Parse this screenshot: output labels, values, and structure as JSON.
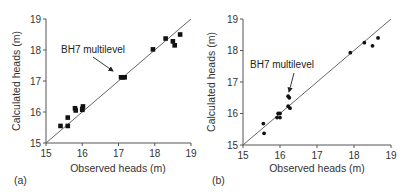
{
  "chart_data": [
    {
      "type": "scatter",
      "panel_label": "(a)",
      "xlabel": "Observed heads (m)",
      "ylabel": "Calculated heads (m)",
      "xlim": [
        15,
        19
      ],
      "ylim": [
        15,
        19
      ],
      "xticks": [
        "15",
        "16",
        "17",
        "18",
        "19"
      ],
      "yticks": [
        "15",
        "16",
        "17",
        "18",
        "19"
      ],
      "grid": false,
      "reference_line": "1:1",
      "annotation": {
        "text": "BH7 multilevel",
        "points_to": [
          17.1,
          17.12
        ]
      },
      "marker": "square",
      "points": [
        [
          15.4,
          15.55
        ],
        [
          15.6,
          15.55
        ],
        [
          15.6,
          15.82
        ],
        [
          15.8,
          16.12
        ],
        [
          15.82,
          16.05
        ],
        [
          16.0,
          16.07
        ],
        [
          16.02,
          16.18
        ],
        [
          16.0,
          16.1
        ],
        [
          17.07,
          17.12
        ],
        [
          17.12,
          17.12
        ],
        [
          17.17,
          17.12
        ],
        [
          17.95,
          18.02
        ],
        [
          18.3,
          18.37
        ],
        [
          18.5,
          18.28
        ],
        [
          18.55,
          18.15
        ],
        [
          18.7,
          18.5
        ]
      ]
    },
    {
      "type": "scatter",
      "panel_label": "(b)",
      "xlabel": "Observed heads (m)",
      "ylabel": "Calculated heads (m)",
      "xlim": [
        15,
        19
      ],
      "ylim": [
        15,
        19
      ],
      "xticks": [
        "15",
        "16",
        "17",
        "18",
        "19"
      ],
      "yticks": [
        "15",
        "16",
        "17",
        "18",
        "19"
      ],
      "grid": false,
      "reference_line": "1:1",
      "annotation": {
        "text": "BH7 multilevel",
        "points_to": [
          16.22,
          16.5
        ]
      },
      "marker": "dot",
      "points": [
        [
          15.55,
          15.68
        ],
        [
          15.57,
          15.37
        ],
        [
          15.92,
          15.87
        ],
        [
          16.0,
          15.87
        ],
        [
          15.95,
          16.0
        ],
        [
          16.0,
          16.0
        ],
        [
          16.22,
          16.55
        ],
        [
          16.25,
          16.5
        ],
        [
          16.22,
          16.23
        ],
        [
          16.27,
          16.17
        ],
        [
          17.9,
          17.93
        ],
        [
          18.28,
          18.25
        ],
        [
          18.5,
          18.15
        ],
        [
          18.65,
          18.4
        ]
      ]
    }
  ],
  "panels": {
    "a": {
      "label": "(a)",
      "xlabel": "Observed heads (m)",
      "ylabel": "Calculated heads (m)",
      "annotation": "BH7 multilevel",
      "xticks": [
        "15",
        "16",
        "17",
        "18",
        "19"
      ],
      "yticks": [
        "15",
        "16",
        "17",
        "18",
        "19"
      ]
    },
    "b": {
      "label": "(b)",
      "xlabel": "Observed heads (m)",
      "ylabel": "Calculated heads (m)",
      "annotation": "BH7 multilevel",
      "xticks": [
        "15",
        "16",
        "17",
        "18",
        "19"
      ],
      "yticks": [
        "15",
        "16",
        "17",
        "18",
        "19"
      ]
    }
  }
}
